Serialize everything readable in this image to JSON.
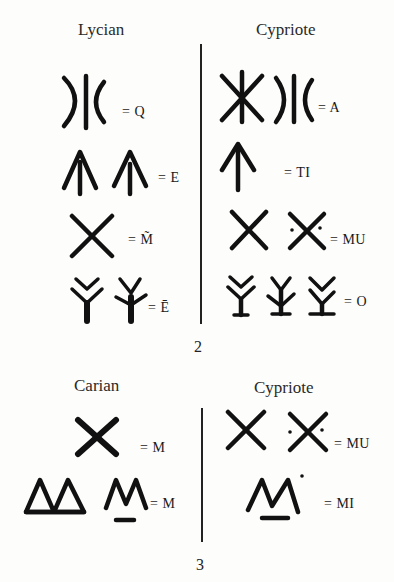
{
  "figure_2": {
    "number": "2",
    "left_heading": "Lycian",
    "right_heading": "Cypriote",
    "left_rows": [
      {
        "value": "= Q",
        "glyphs": [
          "lycian-q-glyph"
        ]
      },
      {
        "value": "= E",
        "glyphs": [
          "lycian-e-glyph-1",
          "lycian-e-glyph-2"
        ]
      },
      {
        "value": "= M̃",
        "glyphs": [
          "lycian-m-tilde-glyph"
        ]
      },
      {
        "value": "= Ē",
        "glyphs": [
          "lycian-e-macron-glyph-1",
          "lycian-e-macron-glyph-2"
        ]
      }
    ],
    "right_rows": [
      {
        "value": "= A",
        "glyphs": [
          "cypriote-a-glyph-1",
          "cypriote-a-glyph-2"
        ]
      },
      {
        "value": "= TI",
        "glyphs": [
          "cypriote-ti-glyph"
        ]
      },
      {
        "value": "= MU",
        "glyphs": [
          "cypriote-mu-glyph-1",
          "cypriote-mu-glyph-2"
        ]
      },
      {
        "value": "= O",
        "glyphs": [
          "cypriote-o-glyph-1",
          "cypriote-o-glyph-2",
          "cypriote-o-glyph-3"
        ]
      }
    ]
  },
  "figure_3": {
    "number": "3",
    "left_heading": "Carian",
    "right_heading": "Cypriote",
    "left_rows": [
      {
        "value": "= M",
        "glyphs": [
          "carian-m-glyph-x"
        ]
      },
      {
        "value": "= M",
        "glyphs": [
          "carian-m-glyph-triangles",
          "carian-m-glyph-underlined"
        ]
      }
    ],
    "right_rows": [
      {
        "value": "= MU",
        "glyphs": [
          "cypriote-mu-glyph-1",
          "cypriote-mu-glyph-2"
        ]
      },
      {
        "value": "= MI",
        "glyphs": [
          "cypriote-mi-glyph"
        ]
      }
    ]
  }
}
